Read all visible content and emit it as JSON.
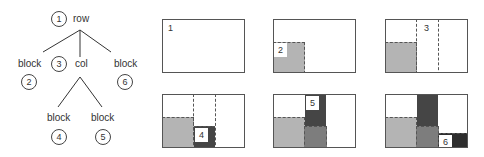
{
  "tree": {
    "nodes": [
      {
        "id": "1",
        "label": "row"
      },
      {
        "id": "2",
        "label": "block"
      },
      {
        "id": "3",
        "label": "col"
      },
      {
        "id": "4",
        "label": "block"
      },
      {
        "id": "5",
        "label": "block"
      },
      {
        "id": "6",
        "label": "block"
      }
    ]
  },
  "panels": [
    {
      "step": "1"
    },
    {
      "step": "2"
    },
    {
      "step": "3"
    },
    {
      "step": "4"
    },
    {
      "step": "5"
    },
    {
      "step": "6"
    }
  ],
  "colors": {
    "light_gray": "#b4b4b4",
    "mid_gray": "#7d7d7d",
    "dark_gray": "#454545",
    "border": "#555555"
  }
}
